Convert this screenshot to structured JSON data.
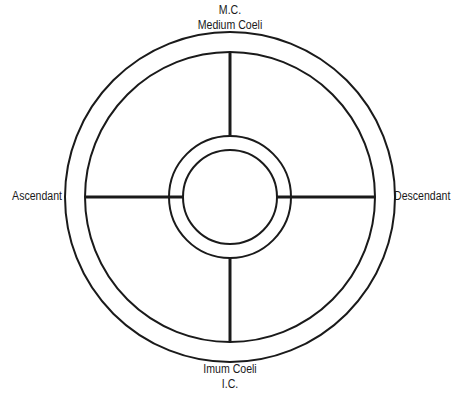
{
  "diagram": {
    "labels": {
      "top_abbr": "M.C.",
      "top_name": "Medium Coeli",
      "left": "Ascendant",
      "right": "Descendant",
      "bottom_name": "Imum Coeli",
      "bottom_abbr": "I.C."
    },
    "geometry": {
      "center": [
        230,
        197
      ],
      "outer_ring_radius": 165,
      "house_ring_radius": 145,
      "inner_ring_outer_radius": 61,
      "inner_ring_inner_radius": 47
    },
    "colors": {
      "stroke": "#1a1a1a",
      "background": "#ffffff"
    }
  }
}
